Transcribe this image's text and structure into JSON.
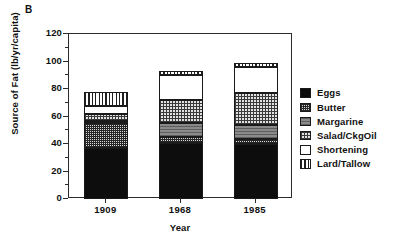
{
  "panel_label": "B",
  "chart_data": {
    "type": "bar",
    "subtype": "stacked-bar",
    "title": "",
    "panel": "B",
    "xlabel": "Year",
    "ylabel": "Source of Fat (lb/yr/capita)",
    "categories": [
      "1909",
      "1968",
      "1985"
    ],
    "ylim": [
      0,
      120
    ],
    "yticks": [
      0,
      20,
      40,
      60,
      80,
      100,
      120
    ],
    "ytick_labels": [
      "0",
      "20",
      "40",
      "60",
      "80",
      "100",
      "120"
    ],
    "y_minor_ticks": [
      10,
      30,
      50,
      70,
      90,
      110
    ],
    "grid": false,
    "legend_position": "right-outside",
    "series": [
      {
        "name": "Eggs",
        "pattern": "solid-black",
        "values": [
          37,
          41,
          40
        ]
      },
      {
        "name": "Butter",
        "pattern": "dense-checker",
        "values": [
          18,
          4,
          4
        ]
      },
      {
        "name": "Margarine",
        "pattern": "solid-gray",
        "values": [
          2,
          10,
          10
        ]
      },
      {
        "name": "Salad/CkgOil",
        "pattern": "light-crosshatch",
        "values": [
          5,
          17,
          23
        ]
      },
      {
        "name": "Shortening",
        "pattern": "white",
        "values": [
          6,
          18,
          19
        ]
      },
      {
        "name": "Lard/Tallow",
        "pattern": "vertical-stripes",
        "values": [
          10,
          3,
          3
        ]
      }
    ],
    "totals": [
      78,
      93,
      99
    ]
  },
  "legend": {
    "items": [
      {
        "label": "Eggs"
      },
      {
        "label": "Butter"
      },
      {
        "label": "Margarine"
      },
      {
        "label": "Salad/CkgOil"
      },
      {
        "label": "Shortening"
      },
      {
        "label": "Lard/Tallow"
      }
    ]
  },
  "colors": {
    "axis": "#2b2b2b",
    "text": "#111111",
    "eggs": "#0d0d0d",
    "margarine": "#8a8a8a",
    "butter_bg": "#d8d8d8",
    "salad_bg": "#e2e2e2",
    "shortening": "#ffffff",
    "lard_bg": "#ffffff"
  }
}
